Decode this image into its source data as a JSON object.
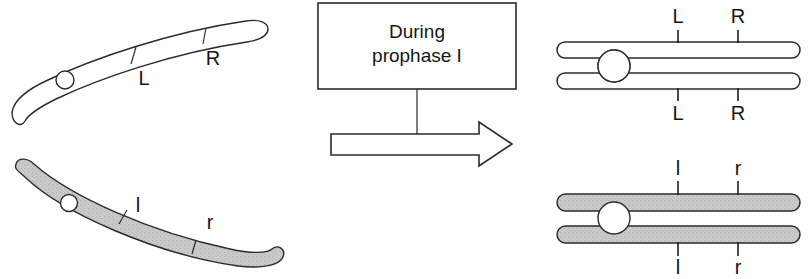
{
  "figure": {
    "background_color": "#ffffff",
    "line_color": "#2b2b2b",
    "text_color": "#151515",
    "shaded_fill_color": "#c9c9c9"
  },
  "callout_box": {
    "line1": "During",
    "line2": "prophase I",
    "full_text": "During prophase I"
  },
  "arrow": {
    "name": "process-arrow",
    "direction": "right",
    "fill": "#ffffff",
    "stroke": "#2b2b2b"
  },
  "left_panel": {
    "caption": "Unreplicated homologous chromosomes",
    "chromosomes": [
      {
        "id": "maternal-unreplicated",
        "shading": "unshaded",
        "fill": "#ffffff",
        "markers": [
          {
            "label": "L",
            "case": "uppercase"
          },
          {
            "label": "R",
            "case": "uppercase"
          }
        ],
        "centromere": true
      },
      {
        "id": "paternal-unreplicated",
        "shading": "shaded",
        "fill": "#c9c9c9",
        "markers": [
          {
            "label": "l",
            "case": "lowercase"
          },
          {
            "label": "r",
            "case": "lowercase"
          }
        ],
        "centromere": true
      }
    ]
  },
  "right_panel": {
    "caption": "Replicated chromosomes with sister chromatids",
    "chromosomes": [
      {
        "id": "maternal-replicated",
        "shading": "unshaded",
        "fill": "#ffffff",
        "chromatids": 2,
        "top_markers": [
          {
            "label": "L"
          },
          {
            "label": "R"
          }
        ],
        "bottom_markers": [
          {
            "label": "L"
          },
          {
            "label": "R"
          }
        ],
        "centromere": true
      },
      {
        "id": "paternal-replicated",
        "shading": "shaded",
        "fill": "#c9c9c9",
        "chromatids": 2,
        "top_markers": [
          {
            "label": "l"
          },
          {
            "label": "r"
          }
        ],
        "bottom_markers": [
          {
            "label": "l"
          },
          {
            "label": "r"
          }
        ],
        "centromere": true
      }
    ]
  }
}
